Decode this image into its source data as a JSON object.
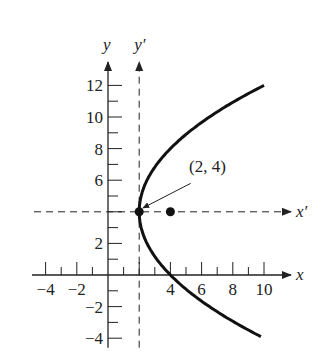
{
  "chart_data": {
    "type": "line",
    "title": "",
    "xlabel": "x",
    "ylabel": "y",
    "translated_axes": {
      "x_prime": "x′",
      "y_prime": "y′",
      "origin": [
        2,
        4
      ]
    },
    "xlim": [
      -4.5,
      10.5
    ],
    "ylim": [
      -4.5,
      13
    ],
    "x_ticks": [
      -4,
      -2,
      4,
      6,
      8,
      10
    ],
    "y_ticks": [
      -4,
      -2,
      2,
      6,
      8,
      10,
      12
    ],
    "x_tick_labels": [
      "−4",
      "−2",
      "4",
      "6",
      "8",
      "10"
    ],
    "y_tick_labels": [
      "−4",
      "−2",
      "2",
      "6",
      "8",
      "10",
      "12"
    ],
    "series": [
      {
        "name": "parabola",
        "equation": "(y-4)^2 = 8(x-2)",
        "x_range": [
          2,
          10
        ],
        "y_range": [
          -4,
          12
        ]
      }
    ],
    "points": [
      {
        "name": "vertex",
        "x": 2,
        "y": 4,
        "label": "(2, 4)"
      },
      {
        "name": "focus",
        "x": 4,
        "y": 4,
        "label": ""
      }
    ],
    "annotation": {
      "text": "(2, 4)",
      "points_to": [
        2,
        4
      ]
    }
  }
}
